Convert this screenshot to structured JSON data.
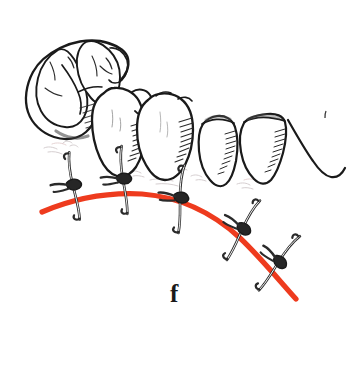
{
  "figure": {
    "label": "f",
    "caption_letter": "f",
    "background_color": "#ffffff",
    "ink_color": "#1a1a1a",
    "incision_color": "#EE3B1E",
    "tissue_tint": "#b9aeb0",
    "width": 359,
    "height": 374
  },
  "illustration": {
    "title": "Interrupted sutures along a curved gingival incision line",
    "teeth": [
      {
        "name": "molar",
        "position": "posterior-left",
        "view": "occlusal-oblique"
      },
      {
        "name": "molar-second",
        "position": "left",
        "view": "buccal"
      },
      {
        "name": "premolar-first",
        "position": "middle",
        "view": "buccal"
      },
      {
        "name": "premolar-second",
        "position": "right",
        "view": "buccal"
      },
      {
        "name": "canine",
        "position": "anterior-right",
        "view": "buccal"
      }
    ],
    "incision_line": {
      "name": "red-incision-line",
      "color": "#EE3B1E",
      "stroke_width": 5,
      "start": [
        42,
        212
      ],
      "end": [
        296,
        299
      ]
    },
    "sutures": [
      {
        "id": 1,
        "x": 74,
        "y": 186,
        "angle": -8,
        "label": "suture-knot-1"
      },
      {
        "id": 2,
        "x": 124,
        "y": 180,
        "angle": -4,
        "label": "suture-knot-2"
      },
      {
        "id": 3,
        "x": 181,
        "y": 199,
        "angle": 6,
        "label": "suture-knot-3"
      },
      {
        "id": 4,
        "x": 243,
        "y": 230,
        "angle": 30,
        "label": "suture-knot-4"
      },
      {
        "id": 5,
        "x": 279,
        "y": 263,
        "angle": 38,
        "label": "suture-knot-5"
      }
    ]
  }
}
